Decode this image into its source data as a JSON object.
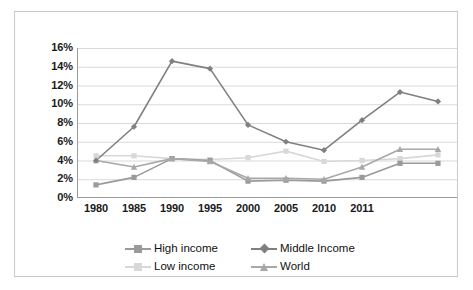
{
  "chart_data": {
    "type": "line",
    "title": "",
    "xlabel": "",
    "ylabel": "",
    "categories": [
      "1980",
      "1985",
      "1990",
      "1995",
      "2000",
      "2005",
      "2010",
      "2011",
      "",
      ""
    ],
    "x_tick_labels": [
      "1980",
      "1985",
      "1990",
      "1995",
      "2000",
      "2005",
      "2010",
      "2011",
      "",
      ""
    ],
    "y_tick_labels": [
      "0%",
      "2%",
      "4%",
      "6%",
      "8%",
      "10%",
      "12%",
      "14%",
      "16%"
    ],
    "y_tick_values": [
      0,
      2,
      4,
      6,
      8,
      10,
      12,
      14,
      16
    ],
    "ylim": [
      0,
      16
    ],
    "y_unit": "%",
    "grid": "horizontal",
    "legend_position": "bottom",
    "series": [
      {
        "name": "High income",
        "color": "#9a9a9a",
        "marker": "square",
        "values": [
          1.4,
          2.2,
          4.2,
          4.0,
          1.8,
          1.9,
          1.8,
          2.2,
          3.7,
          3.7
        ]
      },
      {
        "name": "Middle Income",
        "color": "#808080",
        "marker": "diamond",
        "values": [
          4.0,
          7.6,
          14.6,
          13.8,
          7.8,
          6.0,
          5.1,
          8.3,
          11.3,
          10.3
        ]
      },
      {
        "name": "Low income",
        "color": "#d8d8d8",
        "marker": "square",
        "values": [
          4.5,
          4.5,
          4.2,
          4.1,
          4.3,
          5.0,
          3.9,
          4.0,
          4.2,
          4.6
        ]
      },
      {
        "name": "World",
        "color": "#a8a8a8",
        "marker": "triangle",
        "values": [
          4.0,
          3.3,
          4.2,
          3.9,
          2.1,
          2.1,
          2.0,
          3.3,
          5.2,
          5.2
        ]
      }
    ]
  },
  "legend": {
    "entries": [
      {
        "label": "High income",
        "color": "#9a9a9a",
        "marker": "square"
      },
      {
        "label": "Middle Income",
        "color": "#808080",
        "marker": "diamond"
      },
      {
        "label": "Low income",
        "color": "#d8d8d8",
        "marker": "square"
      },
      {
        "label": "World",
        "color": "#a8a8a8",
        "marker": "triangle"
      }
    ]
  },
  "style": {
    "frame_color": "#c9c9c9",
    "axis_color": "#9b9b9b",
    "grid_color": "#d9d9d9",
    "background": "#ffffff",
    "text_color": "#1a1a1a"
  }
}
